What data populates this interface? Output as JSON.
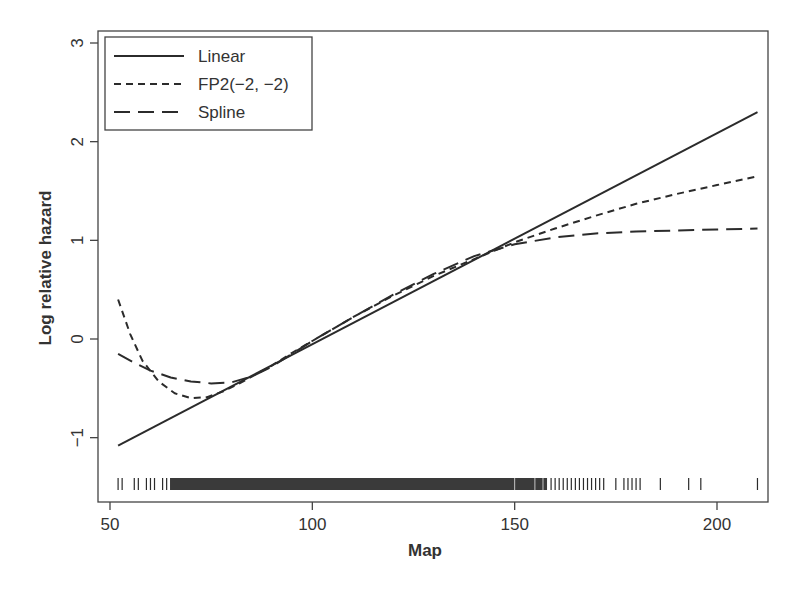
{
  "chart_data": {
    "type": "line",
    "title": "",
    "xlabel": "Map",
    "ylabel": "Log relative hazard",
    "xlim": [
      45,
      213
    ],
    "ylim": [
      -1.65,
      3.12
    ],
    "xticks": [
      50,
      100,
      150,
      200
    ],
    "xtick_labels": [
      "50",
      "100",
      "150",
      "200"
    ],
    "yticks": [
      -1,
      0,
      1,
      2,
      3
    ],
    "ytick_labels": [
      "−1",
      "0",
      "1",
      "2",
      "3"
    ],
    "grid": false,
    "legend_position": "top-left",
    "series": [
      {
        "name": "Linear",
        "style": "solid",
        "x": [
          52,
          210
        ],
        "y": [
          -1.08,
          2.3
        ]
      },
      {
        "name": "FP2(−2, −2)",
        "style": "short-dash",
        "x": [
          52,
          55,
          58,
          62,
          66,
          70,
          74,
          78,
          82,
          86,
          90,
          95,
          100,
          110,
          120,
          130,
          140,
          150,
          160,
          170,
          180,
          190,
          200,
          210
        ],
        "y": [
          0.4,
          0.05,
          -0.22,
          -0.43,
          -0.55,
          -0.6,
          -0.59,
          -0.53,
          -0.45,
          -0.36,
          -0.27,
          -0.14,
          -0.02,
          0.22,
          0.44,
          0.64,
          0.81,
          0.98,
          1.12,
          1.25,
          1.37,
          1.47,
          1.56,
          1.65
        ]
      },
      {
        "name": "Spline",
        "style": "long-dash",
        "x": [
          52,
          56,
          60,
          65,
          70,
          75,
          80,
          85,
          90,
          95,
          100,
          110,
          120,
          130,
          140,
          150,
          160,
          170,
          180,
          190,
          200,
          210
        ],
        "y": [
          -0.15,
          -0.24,
          -0.32,
          -0.39,
          -0.43,
          -0.45,
          -0.44,
          -0.38,
          -0.28,
          -0.15,
          -0.02,
          0.22,
          0.45,
          0.66,
          0.84,
          0.96,
          1.03,
          1.07,
          1.09,
          1.1,
          1.11,
          1.12
        ]
      }
    ],
    "rug": {
      "description": "Tick marks along the bottom showing observed Map values",
      "x_sparse_left": [
        52,
        53,
        56,
        57,
        59,
        60,
        61,
        63,
        64,
        65
      ],
      "x_dense_range": [
        65,
        158
      ],
      "x_sparse_right": [
        159,
        160,
        161,
        162,
        163,
        164,
        165,
        166,
        167,
        168,
        169,
        170,
        171,
        172,
        175,
        177,
        178,
        179,
        180,
        181,
        186,
        193,
        196,
        210
      ]
    }
  },
  "legend": {
    "items": [
      {
        "label": "Linear",
        "style": "solid"
      },
      {
        "label": "FP2(−2, −2)",
        "style": "short-dash"
      },
      {
        "label": "Spline",
        "style": "long-dash"
      }
    ]
  },
  "colors": {
    "line": "#2b2b2b",
    "axis": "#444444",
    "text": "#333333",
    "background": "#ffffff"
  }
}
